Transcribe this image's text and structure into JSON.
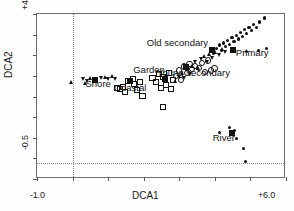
{
  "chart_data": {
    "type": "scatter",
    "title": "",
    "xlabel": "DCA1",
    "ylabel": "DCA2",
    "xlim": [
      -1.0,
      6.0
    ],
    "ylim": [
      -0.5,
      4.5
    ],
    "xticks": [
      "-1.0",
      "+6.0"
    ],
    "yticks": [
      "+4.5",
      "-0.5"
    ],
    "xtick_count": 8,
    "ytick_count": 9,
    "grid": false,
    "legend": "none",
    "reference_lines": {
      "vertical_x": 0.0,
      "horizontal_y": 0.0
    },
    "annotations": [
      {
        "label": "Old secondary",
        "x": 2.95,
        "y": 3.62
      },
      {
        "label": "Primary",
        "x": 5.05,
        "y": 3.32
      },
      {
        "label": "Young secondary",
        "x": 3.4,
        "y": 2.72
      },
      {
        "label": "Garden",
        "x": 2.15,
        "y": 2.8
      },
      {
        "label": "Shore",
        "x": 0.72,
        "y": 2.38
      },
      {
        "label": "Coastal",
        "x": 1.62,
        "y": 2.25
      },
      {
        "label": "River",
        "x": 4.25,
        "y": 0.75
      }
    ],
    "marker_legend": {
      "filled-square": "group centroid",
      "filled-circle": "Primary / River sample",
      "open-circle": "Young secondary sample",
      "open-square": "Coastal / Garden sample",
      "triangle": "Shore / secondary sample"
    },
    "series": [
      {
        "name": "Shore",
        "marker": "triangle",
        "centroid": {
          "x": 0.62,
          "y": 2.5
        },
        "points": [
          {
            "x": -0.03,
            "y": 2.44
          },
          {
            "x": 0.3,
            "y": 2.52
          },
          {
            "x": 0.36,
            "y": 2.41
          },
          {
            "x": 0.43,
            "y": 2.46
          },
          {
            "x": 0.5,
            "y": 2.56
          },
          {
            "x": 0.82,
            "y": 2.56
          },
          {
            "x": 0.92,
            "y": 2.58
          },
          {
            "x": 1.02,
            "y": 2.54
          },
          {
            "x": 1.12,
            "y": 2.62
          },
          {
            "x": 1.2,
            "y": 2.52
          }
        ]
      },
      {
        "name": "Coastal",
        "marker": "open-square",
        "centroid": {
          "x": 1.62,
          "y": 2.46
        },
        "points": [
          {
            "x": 1.22,
            "y": 2.28
          },
          {
            "x": 1.3,
            "y": 2.26
          },
          {
            "x": 1.38,
            "y": 2.32
          },
          {
            "x": 1.44,
            "y": 2.16
          },
          {
            "x": 1.52,
            "y": 2.5
          },
          {
            "x": 1.68,
            "y": 2.56
          },
          {
            "x": 1.7,
            "y": 2.42
          },
          {
            "x": 1.78,
            "y": 2.22
          },
          {
            "x": 1.86,
            "y": 2.48
          },
          {
            "x": 1.94,
            "y": 2.04
          }
        ]
      },
      {
        "name": "Garden",
        "marker": "open-square",
        "centroid": {
          "x": 2.6,
          "y": 2.52
        },
        "points": [
          {
            "x": 2.22,
            "y": 2.6
          },
          {
            "x": 2.32,
            "y": 2.46
          },
          {
            "x": 2.4,
            "y": 2.7
          },
          {
            "x": 2.46,
            "y": 2.3
          },
          {
            "x": 2.52,
            "y": 2.62
          },
          {
            "x": 2.6,
            "y": 2.38
          },
          {
            "x": 2.68,
            "y": 2.74
          },
          {
            "x": 2.74,
            "y": 2.26
          },
          {
            "x": 2.8,
            "y": 2.54
          },
          {
            "x": 2.52,
            "y": 1.7
          }
        ]
      },
      {
        "name": "Young secondary",
        "marker": "open-circle",
        "centroid": {
          "x": 3.18,
          "y": 2.88
        },
        "points": [
          {
            "x": 2.88,
            "y": 2.66
          },
          {
            "x": 2.96,
            "y": 2.82
          },
          {
            "x": 3.02,
            "y": 2.52
          },
          {
            "x": 3.1,
            "y": 2.94
          },
          {
            "x": 3.18,
            "y": 2.74
          },
          {
            "x": 3.26,
            "y": 3.02
          },
          {
            "x": 3.34,
            "y": 2.86
          },
          {
            "x": 3.42,
            "y": 2.96
          },
          {
            "x": 3.52,
            "y": 2.9
          },
          {
            "x": 3.62,
            "y": 3.04
          },
          {
            "x": 3.7,
            "y": 2.78
          },
          {
            "x": 3.78,
            "y": 3.12
          },
          {
            "x": 3.86,
            "y": 2.82
          },
          {
            "x": 3.96,
            "y": 2.88
          }
        ]
      },
      {
        "name": "Old secondary",
        "marker": "triangle",
        "centroid": {
          "x": 3.92,
          "y": 3.4
        },
        "points": [
          {
            "x": 2.9,
            "y": 2.46
          },
          {
            "x": 3.0,
            "y": 2.6
          },
          {
            "x": 3.08,
            "y": 2.72
          },
          {
            "x": 3.14,
            "y": 2.56
          },
          {
            "x": 3.22,
            "y": 2.84
          },
          {
            "x": 3.3,
            "y": 2.68
          },
          {
            "x": 3.38,
            "y": 2.92
          },
          {
            "x": 3.46,
            "y": 3.04
          },
          {
            "x": 3.54,
            "y": 2.86
          },
          {
            "x": 3.62,
            "y": 3.14
          },
          {
            "x": 3.7,
            "y": 3.22
          },
          {
            "x": 3.78,
            "y": 3.06
          },
          {
            "x": 3.86,
            "y": 3.28
          },
          {
            "x": 3.94,
            "y": 3.16
          },
          {
            "x": 4.02,
            "y": 3.34
          },
          {
            "x": 4.12,
            "y": 3.26
          },
          {
            "x": 4.2,
            "y": 3.44
          },
          {
            "x": 4.3,
            "y": 3.36
          }
        ]
      },
      {
        "name": "Primary",
        "marker": "filled-circle",
        "centroid": {
          "x": 4.52,
          "y": 3.42
        },
        "points": [
          {
            "x": 3.96,
            "y": 3.32
          },
          {
            "x": 4.04,
            "y": 3.46
          },
          {
            "x": 4.12,
            "y": 3.56
          },
          {
            "x": 4.18,
            "y": 3.4
          },
          {
            "x": 4.24,
            "y": 3.62
          },
          {
            "x": 4.3,
            "y": 3.52
          },
          {
            "x": 4.36,
            "y": 3.7
          },
          {
            "x": 4.42,
            "y": 3.58
          },
          {
            "x": 4.48,
            "y": 3.78
          },
          {
            "x": 4.54,
            "y": 3.66
          },
          {
            "x": 4.6,
            "y": 3.86
          },
          {
            "x": 4.66,
            "y": 3.74
          },
          {
            "x": 4.72,
            "y": 3.94
          },
          {
            "x": 4.78,
            "y": 3.82
          },
          {
            "x": 4.84,
            "y": 4.02
          },
          {
            "x": 4.9,
            "y": 3.92
          },
          {
            "x": 4.96,
            "y": 4.1
          },
          {
            "x": 5.02,
            "y": 4.0
          },
          {
            "x": 5.08,
            "y": 4.18
          },
          {
            "x": 5.16,
            "y": 4.08
          },
          {
            "x": 5.26,
            "y": 4.26
          },
          {
            "x": 5.4,
            "y": 4.38
          },
          {
            "x": 4.88,
            "y": 3.36
          },
          {
            "x": 5.22,
            "y": 3.4
          },
          {
            "x": 5.46,
            "y": 3.46
          }
        ]
      },
      {
        "name": "River",
        "marker": "filled-circle",
        "centroid": {
          "x": 4.48,
          "y": 0.88
        },
        "points": [
          {
            "x": 4.14,
            "y": 0.92
          },
          {
            "x": 4.42,
            "y": 1.06
          },
          {
            "x": 4.56,
            "y": 0.98
          },
          {
            "x": 4.62,
            "y": 0.72
          },
          {
            "x": 4.8,
            "y": 0.42
          },
          {
            "x": 4.86,
            "y": 0.04
          }
        ]
      }
    ]
  }
}
